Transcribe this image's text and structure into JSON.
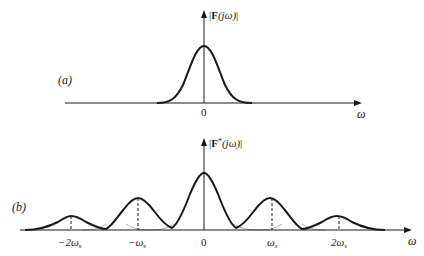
{
  "panel_a": {
    "label": "(a)",
    "y_axis_label": "|F(jω)|",
    "y_axis_label_parts": {
      "bar_left": "|",
      "F": "F",
      "arg": "(jω)",
      "bar_right": "|"
    },
    "x_axis_label": "ω",
    "ticks": [
      {
        "label": "0",
        "position": 0
      }
    ],
    "curve": "single bell-shaped spectrum centered at ω = 0"
  },
  "panel_b": {
    "label": "(b)",
    "y_axis_label": "|F*(jω)|",
    "y_axis_label_parts": {
      "bar_left": "|",
      "F": "F",
      "star": "*",
      "arg": "(jω)",
      "bar_right": "|"
    },
    "x_axis_label": "ω",
    "ticks": [
      {
        "label": "−2ωs",
        "main": "−2ω",
        "sub": "s",
        "position": -2
      },
      {
        "label": "−ωs",
        "main": "−ω",
        "sub": "s",
        "position": -1
      },
      {
        "label": "0",
        "main": "0",
        "sub": "",
        "position": 0
      },
      {
        "label": "ωs",
        "main": "ω",
        "sub": "s",
        "position": 1
      },
      {
        "label": "2ωs",
        "main": "2ω",
        "sub": "s",
        "position": 2
      }
    ],
    "curve": "periodic replicas of spectrum at multiples of ωs, overlapping (aliasing)",
    "relative_peaks": [
      0.25,
      0.55,
      1.0,
      0.55,
      0.25
    ]
  },
  "colors": {
    "ink": "#1a1a1a",
    "background": "#ffffff"
  }
}
